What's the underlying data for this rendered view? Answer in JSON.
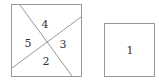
{
  "diagram": {
    "left_square": {
      "regions": [
        {
          "label": "4",
          "x": 45,
          "y": 24
        },
        {
          "label": "5",
          "x": 28,
          "y": 44
        },
        {
          "label": "3",
          "x": 63,
          "y": 45
        },
        {
          "label": "2",
          "x": 45,
          "y": 63
        }
      ]
    },
    "right_square": {
      "regions": [
        {
          "label": "1",
          "x": 130,
          "y": 53
        }
      ]
    },
    "colors": {
      "stroke": "#999999",
      "text": "#333333",
      "background": "#ffffff"
    }
  }
}
